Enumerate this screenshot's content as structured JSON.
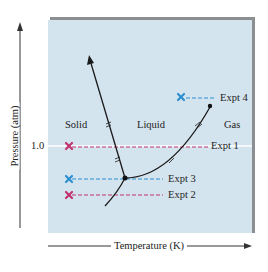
{
  "diagram": {
    "type": "phase-diagram",
    "axes": {
      "x_label": "Temperature (K)",
      "y_label": "Pressure (atm)",
      "y_tick": "1.0"
    },
    "regions": {
      "solid": "Solid",
      "liquid": "Liquid",
      "gas": "Gas"
    },
    "experiments": [
      {
        "label": "Expt 1",
        "color": "#c0336e"
      },
      {
        "label": "Expt 2",
        "color": "#c0336e"
      },
      {
        "label": "Expt 3",
        "color": "#2c8fd0"
      },
      {
        "label": "Expt 4",
        "color": "#2c8fd0"
      }
    ],
    "colors": {
      "panel": "#d4e4ee",
      "panel_shadow": "#8c8f91",
      "curve": "#1a1a1a",
      "axis": "#333333"
    }
  }
}
